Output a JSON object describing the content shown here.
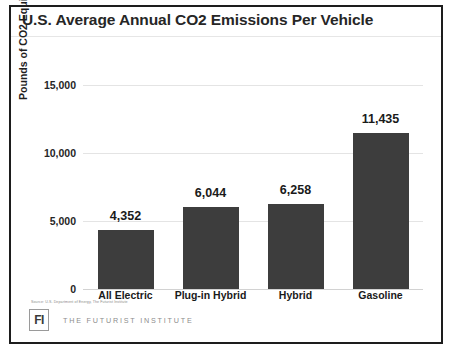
{
  "chart_data": {
    "type": "bar",
    "title": "U.S. Average Annual CO2 Emissions Per Vehicle",
    "xlabel": "",
    "ylabel": "Pounds of CO2 Equivalent",
    "categories": [
      "All Electric",
      "Plug-in Hybrid",
      "Hybrid",
      "Gasoline"
    ],
    "values": [
      4352,
      6044,
      6258,
      11435
    ],
    "value_labels": [
      "4,352",
      "6,044",
      "6,258",
      "11,435"
    ],
    "ylim": [
      0,
      15000
    ],
    "yticks": [
      0,
      5000,
      10000,
      15000
    ],
    "ytick_labels": [
      "0",
      "5,000",
      "10,000",
      "15,000"
    ],
    "grid": true,
    "legend": false,
    "bar_color": "#3d3d3d",
    "gridline_color": "#e4e4e4",
    "text_color": "#1a1a1a"
  },
  "source_note": "Source: U.S. Department of Energy, The Futurist Institute",
  "footer": {
    "logo_mark": "FI",
    "logo_text": "THE FUTURIST INSTITUTE"
  }
}
